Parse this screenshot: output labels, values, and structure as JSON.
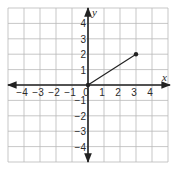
{
  "chart_data": {
    "type": "line",
    "title": "",
    "xlabel": "x",
    "ylabel": "y",
    "xlim": [
      -5,
      5
    ],
    "ylim": [
      -5,
      5
    ],
    "grid": true,
    "x_ticks": [
      -4,
      -3,
      -2,
      -1,
      0,
      1,
      2,
      3,
      4
    ],
    "y_ticks": [
      -4,
      -3,
      -2,
      -1,
      1,
      2,
      3,
      4
    ],
    "x_tick_labels": [
      "−4",
      "−3",
      "−2",
      "−1",
      "0",
      "1",
      "2",
      "3",
      "4"
    ],
    "y_tick_labels": [
      "−4",
      "−3",
      "−2",
      "−1",
      "1",
      "2",
      "3",
      "4"
    ],
    "series": [
      {
        "name": "segment",
        "points": [
          {
            "x": 0,
            "y": 0
          },
          {
            "x": 3,
            "y": 2
          }
        ],
        "markers": [
          {
            "x": 0,
            "y": 0
          },
          {
            "x": 3,
            "y": 2
          }
        ]
      }
    ],
    "axes_arrows": true,
    "legend": null
  },
  "colors": {
    "grid": "#b9b9b9",
    "axis": "#222222",
    "line": "#222222",
    "background": "#ffffff"
  }
}
